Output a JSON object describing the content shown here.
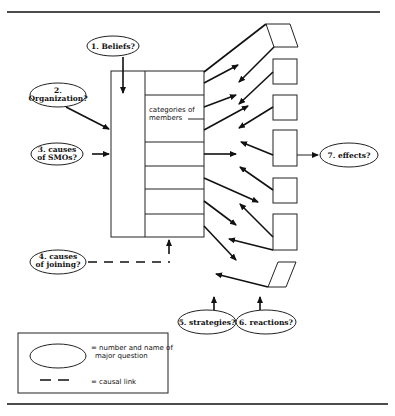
{
  "figure": {
    "questions": [
      {
        "id": "q1",
        "label": "1.  Beliefs?"
      },
      {
        "id": "q2",
        "line1": "2.",
        "line2": "Organization?"
      },
      {
        "id": "q3",
        "line1": "3.  causes",
        "line2": "of SMOs?"
      },
      {
        "id": "q4",
        "line1": "4. causes",
        "line2": "of joining?"
      },
      {
        "id": "q5",
        "label": "5.  strategies?"
      },
      {
        "id": "q6",
        "label": "6.  reactions?"
      },
      {
        "id": "q7",
        "label": "7.  effects?"
      }
    ],
    "organization_box": {
      "categories_line1": "categories of",
      "categories_line2": "members",
      "category_rows": 7
    },
    "legend": {
      "ellipse_line1": "= number and name of",
      "ellipse_line2": "major question",
      "dash_label": "= causal link"
    }
  }
}
